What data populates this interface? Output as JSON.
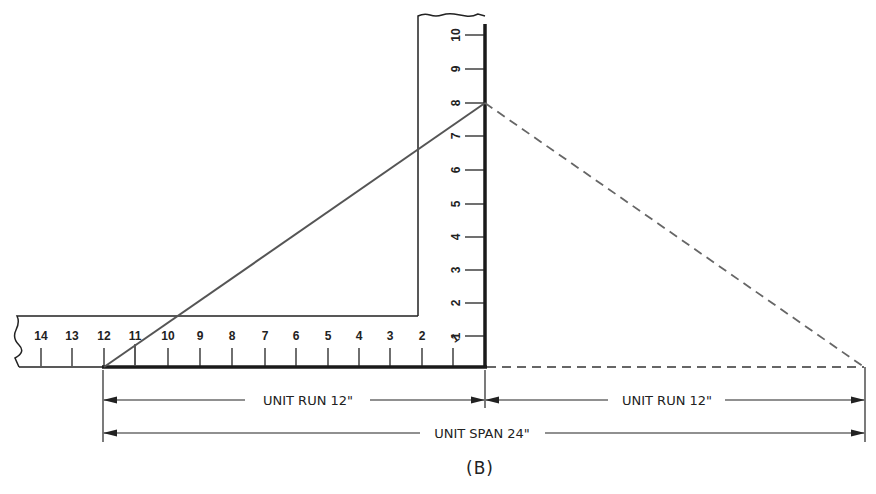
{
  "figure": {
    "caption": "(B)",
    "colors": {
      "ink": "#222222",
      "slope_line": "#555555",
      "dashed": "#666666",
      "background": "#ffffff"
    }
  },
  "square": {
    "blade_marks": [
      "14",
      "13",
      "12",
      "11",
      "10",
      "9",
      "8",
      "7",
      "6",
      "5",
      "4",
      "3",
      "2",
      "1"
    ],
    "tongue_marks": [
      "1",
      "2",
      "3",
      "4",
      "5",
      "6",
      "7",
      "8",
      "9",
      "10"
    ]
  },
  "dimensions": {
    "run_left": "UNIT RUN 12\"",
    "run_right": "UNIT RUN 12\"",
    "span": "UNIT SPAN 24\""
  }
}
